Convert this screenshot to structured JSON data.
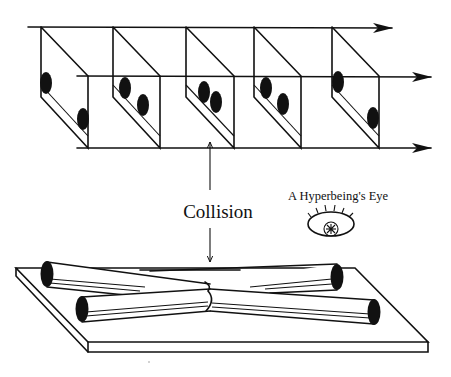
{
  "figure": {
    "labels": {
      "collision": "Collision",
      "eye": "A Hyperbeing's Eye"
    },
    "top_panel": {
      "description": "Sequence of five slanted slabs between three rightward time arrows, each holding two black dots that approach, touch, and separate",
      "slab_count": 5,
      "arrows": [
        "top",
        "middle",
        "bottom"
      ]
    },
    "bottom_panel": {
      "description": "Flat plate with four cylinders (world-tubes) crossing at a central collision point",
      "cylinder_count": 4
    },
    "colors": {
      "ink": "#111111",
      "background": "#ffffff"
    }
  }
}
